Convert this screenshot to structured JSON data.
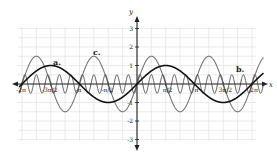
{
  "chart_data": {
    "type": "line",
    "title": "",
    "xlabel": "x",
    "ylabel": "y",
    "xlim": [
      -6.283,
      6.283
    ],
    "ylim": [
      -3,
      3
    ],
    "grid": true,
    "x_tick_labels": [
      "-2π",
      "-3π/2",
      "-π",
      "-π/2",
      "π/2",
      "π",
      "3π/2",
      "2π"
    ],
    "y_tick_labels": [
      "3",
      "2",
      "1",
      "-1",
      "-2",
      "-3"
    ],
    "series": [
      {
        "name": "a.",
        "function": "sin(x)",
        "amplitude": 1,
        "period": "2π",
        "color": "#111111"
      },
      {
        "name": "b.",
        "function": "0.5 sin(10x)",
        "amplitude": 0.5,
        "period": "π/5",
        "color": "#333333"
      },
      {
        "name": "c.",
        "function": "1.5 sin(2x)",
        "amplitude": 1.5,
        "period": "π",
        "color": "#777777"
      }
    ]
  },
  "labels": {
    "x_axis": "x",
    "y_axis": "y",
    "a": "a.",
    "b": "b.",
    "c": "c."
  }
}
